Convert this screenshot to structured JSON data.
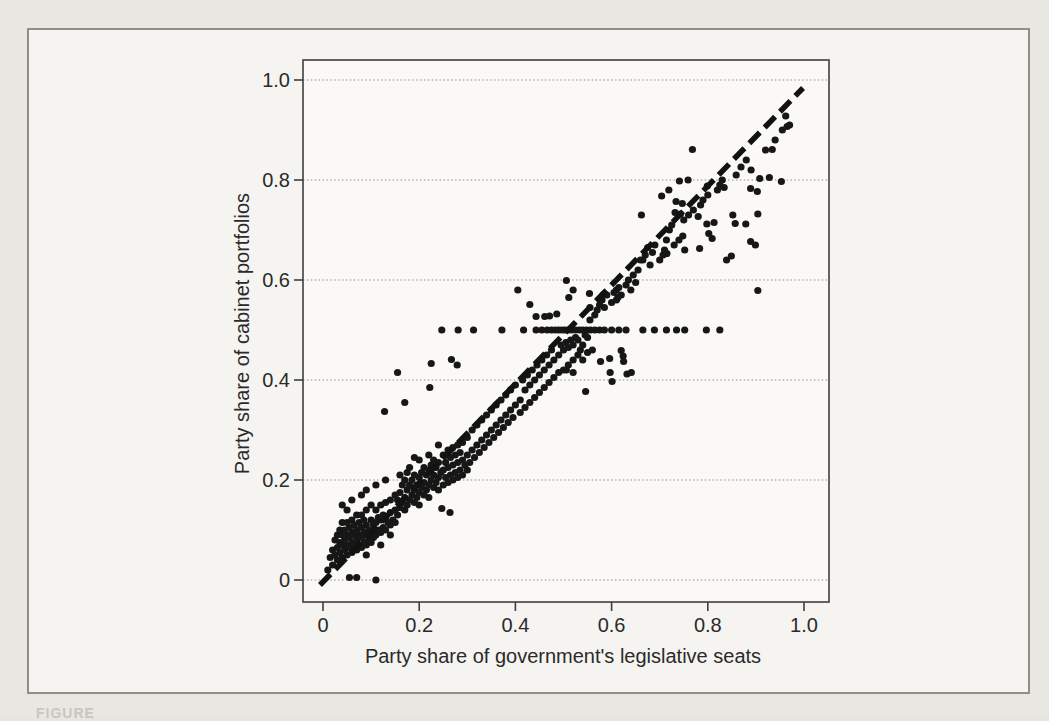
{
  "page": {
    "caption_fragment": "FIGURE"
  },
  "chart_data": {
    "type": "scatter",
    "title": "",
    "xlabel": "Party share of government's legislative seats",
    "ylabel": "Party share of cabinet portfolios",
    "xlim": [
      0,
      1.0
    ],
    "ylim": [
      0,
      1.0
    ],
    "grid": "horizontal dotted gridlines at 0.2 intervals",
    "legend": "none",
    "xticks": {
      "values": [
        0,
        0.2,
        0.4,
        0.6,
        0.8,
        1.0
      ],
      "labels": [
        "0",
        "0.2",
        "0.4",
        "0.6",
        "0.8",
        "1.0"
      ]
    },
    "yticks": {
      "values": [
        0,
        0.2,
        0.4,
        0.6,
        0.8,
        1.0
      ],
      "labels": [
        "0",
        "0.2",
        "0.4",
        "0.6",
        "0.8",
        "1.0"
      ]
    },
    "colors": {
      "points": "#171717",
      "grid": "#8f8f8f",
      "frame": "#3f3f3f",
      "reference_line": "#121212"
    },
    "reference_line": {
      "style": "dashed",
      "from": [
        0,
        0
      ],
      "to": [
        0.998,
        0.984
      ],
      "meaning": "proportionality line y = x"
    },
    "points": [
      [
        0.01,
        0.02
      ],
      [
        0.015,
        0.045
      ],
      [
        0.02,
        0.03
      ],
      [
        0.02,
        0.06
      ],
      [
        0.025,
        0.05
      ],
      [
        0.025,
        0.08
      ],
      [
        0.03,
        0.04
      ],
      [
        0.03,
        0.065
      ],
      [
        0.03,
        0.09
      ],
      [
        0.035,
        0.055
      ],
      [
        0.035,
        0.075
      ],
      [
        0.035,
        0.1
      ],
      [
        0.04,
        0.045
      ],
      [
        0.04,
        0.07
      ],
      [
        0.04,
        0.09
      ],
      [
        0.04,
        0.115
      ],
      [
        0.04,
        0.15
      ],
      [
        0.045,
        0.06
      ],
      [
        0.045,
        0.08
      ],
      [
        0.045,
        0.1
      ],
      [
        0.05,
        0.05
      ],
      [
        0.05,
        0.07
      ],
      [
        0.05,
        0.09
      ],
      [
        0.05,
        0.115
      ],
      [
        0.05,
        0.14
      ],
      [
        0.055,
        0.005
      ],
      [
        0.055,
        0.065
      ],
      [
        0.055,
        0.085
      ],
      [
        0.055,
        0.105
      ],
      [
        0.06,
        0.055
      ],
      [
        0.06,
        0.075
      ],
      [
        0.06,
        0.095
      ],
      [
        0.06,
        0.12
      ],
      [
        0.06,
        0.16
      ],
      [
        0.065,
        0.07
      ],
      [
        0.065,
        0.09
      ],
      [
        0.065,
        0.11
      ],
      [
        0.07,
        0.005
      ],
      [
        0.07,
        0.06
      ],
      [
        0.07,
        0.08
      ],
      [
        0.07,
        0.1
      ],
      [
        0.07,
        0.13
      ],
      [
        0.075,
        0.07
      ],
      [
        0.075,
        0.09
      ],
      [
        0.075,
        0.115
      ],
      [
        0.08,
        0.065
      ],
      [
        0.08,
        0.085
      ],
      [
        0.08,
        0.105
      ],
      [
        0.08,
        0.13
      ],
      [
        0.08,
        0.17
      ],
      [
        0.085,
        0.075
      ],
      [
        0.085,
        0.095
      ],
      [
        0.085,
        0.12
      ],
      [
        0.09,
        0.05
      ],
      [
        0.09,
        0.07
      ],
      [
        0.09,
        0.09
      ],
      [
        0.09,
        0.11
      ],
      [
        0.09,
        0.14
      ],
      [
        0.09,
        0.18
      ],
      [
        0.095,
        0.08
      ],
      [
        0.095,
        0.1
      ],
      [
        0.1,
        0.075
      ],
      [
        0.1,
        0.095
      ],
      [
        0.1,
        0.12
      ],
      [
        0.1,
        0.15
      ],
      [
        0.105,
        0.085
      ],
      [
        0.105,
        0.11
      ],
      [
        0.11,
        0.0
      ],
      [
        0.11,
        0.09
      ],
      [
        0.11,
        0.115
      ],
      [
        0.11,
        0.14
      ],
      [
        0.11,
        0.19
      ],
      [
        0.115,
        0.1
      ],
      [
        0.115,
        0.125
      ],
      [
        0.12,
        0.07
      ],
      [
        0.12,
        0.095
      ],
      [
        0.12,
        0.12
      ],
      [
        0.12,
        0.15
      ],
      [
        0.125,
        0.105
      ],
      [
        0.125,
        0.13
      ],
      [
        0.13,
        0.1
      ],
      [
        0.13,
        0.125
      ],
      [
        0.13,
        0.155
      ],
      [
        0.13,
        0.2
      ],
      [
        0.135,
        0.115
      ],
      [
        0.14,
        0.09
      ],
      [
        0.14,
        0.11
      ],
      [
        0.14,
        0.135
      ],
      [
        0.14,
        0.16
      ],
      [
        0.145,
        0.12
      ],
      [
        0.15,
        0.115
      ],
      [
        0.15,
        0.14
      ],
      [
        0.15,
        0.17
      ],
      [
        0.128,
        0.337
      ],
      [
        0.155,
        0.13
      ],
      [
        0.155,
        0.16
      ],
      [
        0.155,
        0.415
      ],
      [
        0.16,
        0.145
      ],
      [
        0.16,
        0.175
      ],
      [
        0.16,
        0.21
      ],
      [
        0.165,
        0.155
      ],
      [
        0.165,
        0.19
      ],
      [
        0.17,
        0.14
      ],
      [
        0.17,
        0.165
      ],
      [
        0.17,
        0.2
      ],
      [
        0.17,
        0.355
      ],
      [
        0.175,
        0.15
      ],
      [
        0.175,
        0.18
      ],
      [
        0.175,
        0.215
      ],
      [
        0.18,
        0.16
      ],
      [
        0.18,
        0.19
      ],
      [
        0.18,
        0.225
      ],
      [
        0.185,
        0.17
      ],
      [
        0.185,
        0.2
      ],
      [
        0.19,
        0.155
      ],
      [
        0.19,
        0.18
      ],
      [
        0.19,
        0.21
      ],
      [
        0.19,
        0.245
      ],
      [
        0.195,
        0.165
      ],
      [
        0.195,
        0.19
      ],
      [
        0.2,
        0.15
      ],
      [
        0.2,
        0.175
      ],
      [
        0.2,
        0.205
      ],
      [
        0.2,
        0.24
      ],
      [
        0.205,
        0.185
      ],
      [
        0.205,
        0.215
      ],
      [
        0.21,
        0.17
      ],
      [
        0.21,
        0.195
      ],
      [
        0.21,
        0.225
      ],
      [
        0.215,
        0.18
      ],
      [
        0.215,
        0.21
      ],
      [
        0.22,
        0.165
      ],
      [
        0.22,
        0.19
      ],
      [
        0.22,
        0.22
      ],
      [
        0.22,
        0.25
      ],
      [
        0.222,
        0.385
      ],
      [
        0.225,
        0.2
      ],
      [
        0.225,
        0.23
      ],
      [
        0.225,
        0.433
      ],
      [
        0.23,
        0.185
      ],
      [
        0.23,
        0.21
      ],
      [
        0.23,
        0.24
      ],
      [
        0.235,
        0.195
      ],
      [
        0.235,
        0.225
      ],
      [
        0.24,
        0.18
      ],
      [
        0.24,
        0.205
      ],
      [
        0.24,
        0.235
      ],
      [
        0.24,
        0.27
      ],
      [
        0.245,
        0.215
      ],
      [
        0.247,
        0.143
      ],
      [
        0.25,
        0.19
      ],
      [
        0.25,
        0.22
      ],
      [
        0.25,
        0.25
      ],
      [
        0.255,
        0.205
      ],
      [
        0.255,
        0.235
      ],
      [
        0.26,
        0.195
      ],
      [
        0.26,
        0.225
      ],
      [
        0.26,
        0.26
      ],
      [
        0.264,
        0.135
      ],
      [
        0.265,
        0.21
      ],
      [
        0.265,
        0.245
      ],
      [
        0.267,
        0.441
      ],
      [
        0.27,
        0.2
      ],
      [
        0.27,
        0.23
      ],
      [
        0.27,
        0.265
      ],
      [
        0.275,
        0.215
      ],
      [
        0.275,
        0.25
      ],
      [
        0.279,
        0.43
      ],
      [
        0.28,
        0.205
      ],
      [
        0.28,
        0.235
      ],
      [
        0.28,
        0.27
      ],
      [
        0.285,
        0.22
      ],
      [
        0.285,
        0.255
      ],
      [
        0.29,
        0.21
      ],
      [
        0.29,
        0.24
      ],
      [
        0.29,
        0.275
      ],
      [
        0.295,
        0.23
      ],
      [
        0.3,
        0.22
      ],
      [
        0.3,
        0.25
      ],
      [
        0.3,
        0.285
      ],
      [
        0.305,
        0.235
      ],
      [
        0.31,
        0.26
      ],
      [
        0.31,
        0.3
      ],
      [
        0.315,
        0.245
      ],
      [
        0.32,
        0.27
      ],
      [
        0.32,
        0.31
      ],
      [
        0.325,
        0.255
      ],
      [
        0.33,
        0.28
      ],
      [
        0.33,
        0.32
      ],
      [
        0.335,
        0.265
      ],
      [
        0.34,
        0.29
      ],
      [
        0.34,
        0.33
      ],
      [
        0.345,
        0.275
      ],
      [
        0.35,
        0.3
      ],
      [
        0.35,
        0.34
      ],
      [
        0.355,
        0.285
      ],
      [
        0.36,
        0.31
      ],
      [
        0.36,
        0.35
      ],
      [
        0.365,
        0.295
      ],
      [
        0.37,
        0.32
      ],
      [
        0.37,
        0.36
      ],
      [
        0.375,
        0.305
      ],
      [
        0.38,
        0.33
      ],
      [
        0.38,
        0.37
      ],
      [
        0.385,
        0.315
      ],
      [
        0.39,
        0.34
      ],
      [
        0.39,
        0.38
      ],
      [
        0.395,
        0.325
      ],
      [
        0.4,
        0.35
      ],
      [
        0.4,
        0.39
      ],
      [
        0.405,
        0.58
      ],
      [
        0.41,
        0.335
      ],
      [
        0.41,
        0.36
      ],
      [
        0.415,
        0.4
      ],
      [
        0.42,
        0.345
      ],
      [
        0.42,
        0.38
      ],
      [
        0.425,
        0.41
      ],
      [
        0.43,
        0.355
      ],
      [
        0.43,
        0.39
      ],
      [
        0.43,
        0.551
      ],
      [
        0.435,
        0.42
      ],
      [
        0.44,
        0.365
      ],
      [
        0.44,
        0.4
      ],
      [
        0.443,
        0.527
      ],
      [
        0.445,
        0.43
      ],
      [
        0.45,
        0.375
      ],
      [
        0.45,
        0.41
      ],
      [
        0.455,
        0.44
      ],
      [
        0.46,
        0.385
      ],
      [
        0.46,
        0.42
      ],
      [
        0.461,
        0.527
      ],
      [
        0.465,
        0.45
      ],
      [
        0.47,
        0.395
      ],
      [
        0.47,
        0.43
      ],
      [
        0.471,
        0.528
      ],
      [
        0.475,
        0.46
      ],
      [
        0.48,
        0.405
      ],
      [
        0.48,
        0.44
      ],
      [
        0.486,
        0.532
      ],
      [
        0.247,
        0.5
      ],
      [
        0.281,
        0.5
      ],
      [
        0.313,
        0.5
      ],
      [
        0.372,
        0.5
      ],
      [
        0.417,
        0.5
      ],
      [
        0.443,
        0.5
      ],
      [
        0.455,
        0.5
      ],
      [
        0.466,
        0.5
      ],
      [
        0.475,
        0.5
      ],
      [
        0.483,
        0.5
      ],
      [
        0.49,
        0.5
      ],
      [
        0.497,
        0.5
      ],
      [
        0.503,
        0.5
      ],
      [
        0.51,
        0.5
      ],
      [
        0.517,
        0.5
      ],
      [
        0.525,
        0.5
      ],
      [
        0.533,
        0.5
      ],
      [
        0.54,
        0.5
      ],
      [
        0.548,
        0.5
      ],
      [
        0.556,
        0.5
      ],
      [
        0.565,
        0.5
      ],
      [
        0.575,
        0.5
      ],
      [
        0.585,
        0.5
      ],
      [
        0.6,
        0.5
      ],
      [
        0.615,
        0.5
      ],
      [
        0.63,
        0.5
      ],
      [
        0.665,
        0.5
      ],
      [
        0.689,
        0.5
      ],
      [
        0.714,
        0.5
      ],
      [
        0.735,
        0.5
      ],
      [
        0.752,
        0.5
      ],
      [
        0.797,
        0.5
      ],
      [
        0.825,
        0.5
      ],
      [
        0.49,
        0.415
      ],
      [
        0.49,
        0.45
      ],
      [
        0.495,
        0.47
      ],
      [
        0.5,
        0.42
      ],
      [
        0.5,
        0.46
      ],
      [
        0.505,
        0.475
      ],
      [
        0.506,
        0.42
      ],
      [
        0.506,
        0.599
      ],
      [
        0.51,
        0.43
      ],
      [
        0.51,
        0.465
      ],
      [
        0.511,
        0.565
      ],
      [
        0.515,
        0.48
      ],
      [
        0.52,
        0.415
      ],
      [
        0.52,
        0.44
      ],
      [
        0.52,
        0.47
      ],
      [
        0.52,
        0.58
      ],
      [
        0.525,
        0.485
      ],
      [
        0.53,
        0.45
      ],
      [
        0.53,
        0.48
      ],
      [
        0.535,
        0.46
      ],
      [
        0.54,
        0.44
      ],
      [
        0.54,
        0.47
      ],
      [
        0.545,
        0.49
      ],
      [
        0.546,
        0.377
      ],
      [
        0.55,
        0.455
      ],
      [
        0.55,
        0.485
      ],
      [
        0.554,
        0.573
      ],
      [
        0.555,
        0.52
      ],
      [
        0.555,
        0.545
      ],
      [
        0.56,
        0.46
      ],
      [
        0.565,
        0.53
      ],
      [
        0.57,
        0.54
      ],
      [
        0.575,
        0.55
      ],
      [
        0.577,
        0.437
      ],
      [
        0.58,
        0.56
      ],
      [
        0.582,
        0.57
      ],
      [
        0.585,
        0.545
      ],
      [
        0.59,
        0.57
      ],
      [
        0.596,
        0.443
      ],
      [
        0.597,
        0.415
      ],
      [
        0.6,
        0.555
      ],
      [
        0.601,
        0.397
      ],
      [
        0.605,
        0.575
      ],
      [
        0.61,
        0.56
      ],
      [
        0.61,
        0.58
      ],
      [
        0.613,
        0.565
      ],
      [
        0.615,
        0.585
      ],
      [
        0.62,
        0.459
      ],
      [
        0.62,
        0.57
      ],
      [
        0.624,
        0.448
      ],
      [
        0.625,
        0.437
      ],
      [
        0.63,
        0.59
      ],
      [
        0.632,
        0.412
      ],
      [
        0.635,
        0.6
      ],
      [
        0.64,
        0.58
      ],
      [
        0.641,
        0.415
      ],
      [
        0.645,
        0.61
      ],
      [
        0.65,
        0.595
      ],
      [
        0.655,
        0.62
      ],
      [
        0.66,
        0.64
      ],
      [
        0.662,
        0.73
      ],
      [
        0.665,
        0.64
      ],
      [
        0.67,
        0.65
      ],
      [
        0.675,
        0.665
      ],
      [
        0.68,
        0.63
      ],
      [
        0.685,
        0.655
      ],
      [
        0.69,
        0.67
      ],
      [
        0.7,
        0.64
      ],
      [
        0.704,
        0.768
      ],
      [
        0.707,
        0.65
      ],
      [
        0.71,
        0.66
      ],
      [
        0.714,
        0.68
      ],
      [
        0.715,
        0.653
      ],
      [
        0.719,
        0.78
      ],
      [
        0.72,
        0.7
      ],
      [
        0.725,
        0.71
      ],
      [
        0.73,
        0.67
      ],
      [
        0.732,
        0.735
      ],
      [
        0.734,
        0.757
      ],
      [
        0.74,
        0.68
      ],
      [
        0.741,
        0.798
      ],
      [
        0.743,
        0.732
      ],
      [
        0.747,
        0.753
      ],
      [
        0.748,
        0.688
      ],
      [
        0.75,
        0.72
      ],
      [
        0.752,
        0.66
      ],
      [
        0.759,
        0.8
      ],
      [
        0.76,
        0.73
      ],
      [
        0.768,
        0.861
      ],
      [
        0.77,
        0.74
      ],
      [
        0.78,
        0.727
      ],
      [
        0.783,
        0.663
      ],
      [
        0.785,
        0.75
      ],
      [
        0.79,
        0.76
      ],
      [
        0.798,
        0.712
      ],
      [
        0.799,
        0.788
      ],
      [
        0.8,
        0.77
      ],
      [
        0.802,
        0.693
      ],
      [
        0.809,
        0.683
      ],
      [
        0.813,
        0.715
      ],
      [
        0.82,
        0.78
      ],
      [
        0.825,
        0.79
      ],
      [
        0.83,
        0.8
      ],
      [
        0.834,
        0.785
      ],
      [
        0.839,
        0.64
      ],
      [
        0.849,
        0.648
      ],
      [
        0.852,
        0.73
      ],
      [
        0.857,
        0.713
      ],
      [
        0.859,
        0.81
      ],
      [
        0.869,
        0.826
      ],
      [
        0.879,
        0.712
      ],
      [
        0.88,
        0.84
      ],
      [
        0.889,
        0.677
      ],
      [
        0.889,
        0.783
      ],
      [
        0.89,
        0.82
      ],
      [
        0.899,
        0.67
      ],
      [
        0.903,
        0.777
      ],
      [
        0.904,
        0.579
      ],
      [
        0.904,
        0.732
      ],
      [
        0.908,
        0.803
      ],
      [
        0.92,
        0.86
      ],
      [
        0.928,
        0.805
      ],
      [
        0.934,
        0.861
      ],
      [
        0.94,
        0.88
      ],
      [
        0.953,
        0.797
      ],
      [
        0.955,
        0.9
      ],
      [
        0.962,
        0.928
      ],
      [
        0.965,
        0.907
      ],
      [
        0.97,
        0.91
      ]
    ]
  }
}
